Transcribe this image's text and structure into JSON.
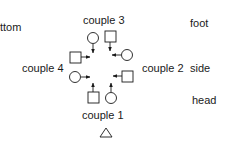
{
  "labels": {
    "bottom": "ttom",
    "foot": "foot",
    "side": "side",
    "head": "head"
  },
  "couples": [
    {
      "label": "couple 1",
      "position": "head"
    },
    {
      "label": "couple 2",
      "position": "right"
    },
    {
      "label": "couple 3",
      "position": "foot"
    },
    {
      "label": "couple 4",
      "position": "left"
    }
  ],
  "legend": {
    "square": "man",
    "circle": "woman",
    "triangle": "caller"
  },
  "colors": {
    "stroke": "#1a1a1a",
    "background": "#ffffff"
  }
}
